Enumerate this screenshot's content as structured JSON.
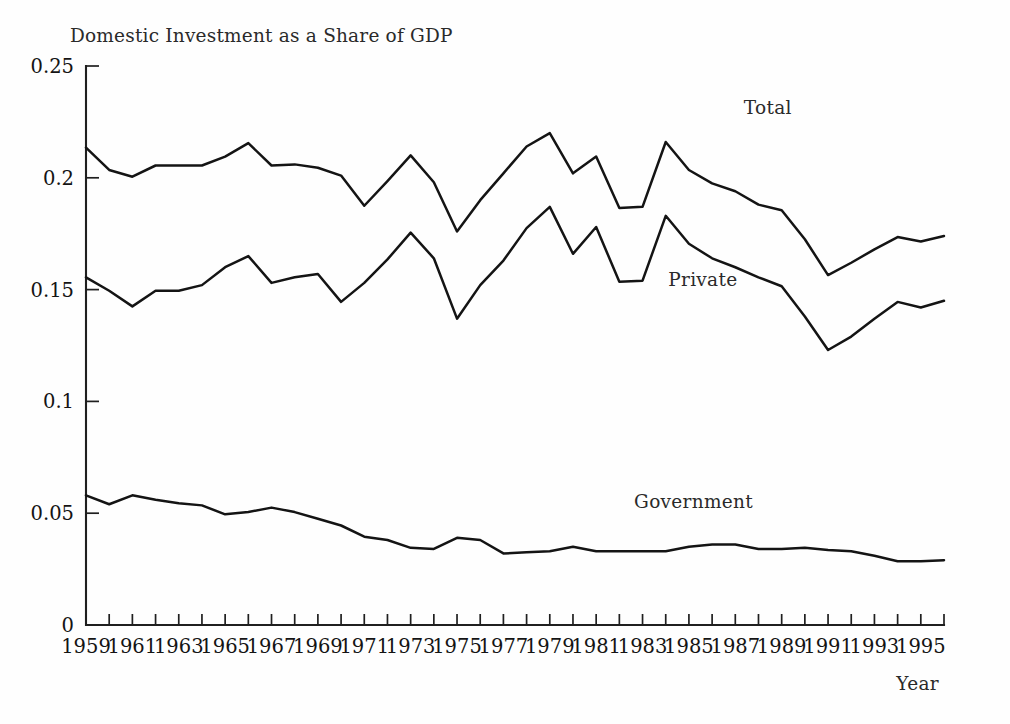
{
  "figure": {
    "width": 1010,
    "height": 724,
    "background": "#ffffff",
    "ink_color": "#141414"
  },
  "chart_data": {
    "type": "line",
    "title": "Domestic Investment as a Share of GDP",
    "xlabel": "Year",
    "ylabel": "",
    "xlim": [
      1959,
      1996
    ],
    "ylim": [
      0,
      0.25
    ],
    "grid": false,
    "legend_position": "inline-annotations",
    "y_ticks": [
      0,
      0.05,
      0.1,
      0.15,
      0.2,
      0.25
    ],
    "y_tick_labels": [
      "0",
      "0.05",
      "0.1",
      "0.15",
      "0.2",
      "0.25"
    ],
    "x_ticks": [
      1959,
      1960,
      1961,
      1962,
      1963,
      1964,
      1965,
      1966,
      1967,
      1968,
      1969,
      1970,
      1971,
      1972,
      1973,
      1974,
      1975,
      1976,
      1977,
      1978,
      1979,
      1980,
      1981,
      1982,
      1983,
      1984,
      1985,
      1986,
      1987,
      1988,
      1989,
      1990,
      1991,
      1992,
      1993,
      1994,
      1995,
      1996
    ],
    "x_tick_labels": [
      "1959",
      "",
      "1961",
      "",
      "1963",
      "",
      "1965",
      "",
      "1967",
      "",
      "1969",
      "",
      "1971",
      "",
      "1973",
      "",
      "1975",
      "",
      "1977",
      "",
      "1979",
      "",
      "1981",
      "",
      "1983",
      "",
      "1985",
      "",
      "1987",
      "",
      "1989",
      "",
      "1991",
      "",
      "1993",
      "",
      "1995",
      ""
    ],
    "x": [
      1959,
      1960,
      1961,
      1962,
      1963,
      1964,
      1965,
      1966,
      1967,
      1968,
      1969,
      1970,
      1971,
      1972,
      1973,
      1974,
      1975,
      1976,
      1977,
      1978,
      1979,
      1980,
      1981,
      1982,
      1983,
      1984,
      1985,
      1986,
      1987,
      1988,
      1989,
      1990,
      1991,
      1992,
      1993,
      1994,
      1995,
      1996
    ],
    "series": [
      {
        "name": "Total",
        "label": "Total",
        "label_point": {
          "x": 1988.4,
          "y": 0.2285
        },
        "color": "#141414",
        "values": [
          0.2135,
          0.2035,
          0.2005,
          0.2055,
          0.2055,
          0.2055,
          0.2095,
          0.2155,
          0.2055,
          0.206,
          0.2045,
          0.201,
          0.1875,
          0.1985,
          0.21,
          0.198,
          0.176,
          0.19,
          0.202,
          0.214,
          0.22,
          0.202,
          0.2095,
          0.1865,
          0.187,
          0.216,
          0.2035,
          0.1975,
          0.194,
          0.188,
          0.1855,
          0.1725,
          0.1565,
          0.162,
          0.168,
          0.1735,
          0.1715,
          0.174
        ]
      },
      {
        "name": "Private",
        "label": "Private",
        "label_point": {
          "x": 1985.6,
          "y": 0.1515
        },
        "color": "#141414",
        "values": [
          0.1555,
          0.1495,
          0.1425,
          0.1495,
          0.1495,
          0.152,
          0.16,
          0.165,
          0.153,
          0.1555,
          0.157,
          0.1445,
          0.153,
          0.1635,
          0.1755,
          0.164,
          0.137,
          0.152,
          0.163,
          0.1775,
          0.187,
          0.166,
          0.178,
          0.1535,
          0.154,
          0.183,
          0.1705,
          0.164,
          0.16,
          0.1555,
          0.1515,
          0.138,
          0.123,
          0.129,
          0.137,
          0.1445,
          0.142,
          0.145
        ]
      },
      {
        "name": "Government",
        "label": "Government",
        "label_point": {
          "x": 1985.2,
          "y": 0.0525
        },
        "color": "#141414",
        "values": [
          0.058,
          0.054,
          0.058,
          0.056,
          0.0545,
          0.0535,
          0.0495,
          0.0505,
          0.0525,
          0.0505,
          0.0475,
          0.0445,
          0.0395,
          0.038,
          0.0345,
          0.034,
          0.039,
          0.038,
          0.032,
          0.0325,
          0.033,
          0.035,
          0.033,
          0.033,
          0.033,
          0.033,
          0.035,
          0.036,
          0.036,
          0.034,
          0.034,
          0.0345,
          0.0335,
          0.033,
          0.031,
          0.0285,
          0.0285,
          0.029
        ]
      }
    ]
  }
}
